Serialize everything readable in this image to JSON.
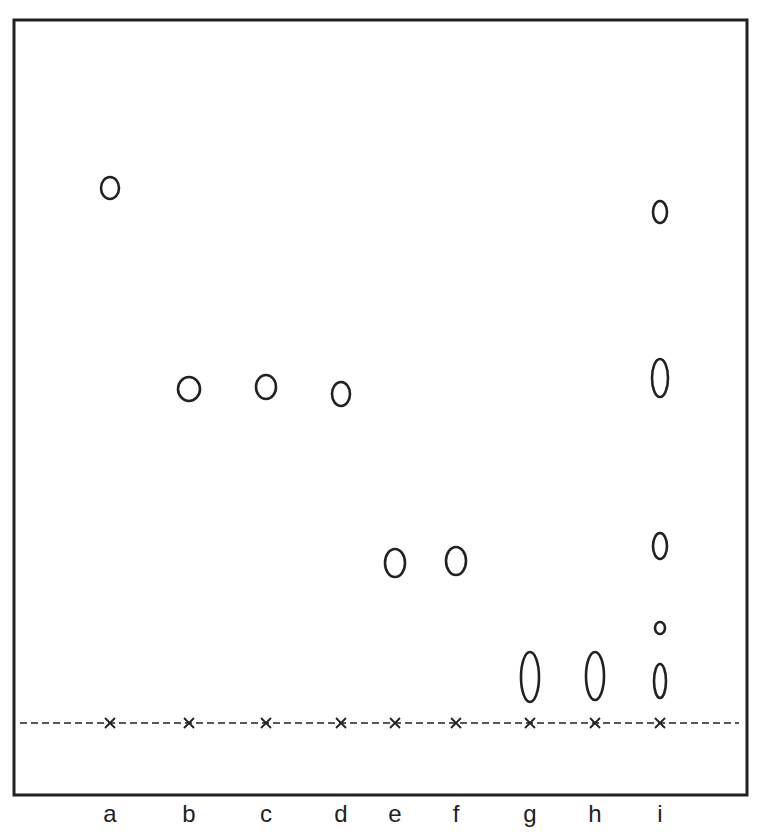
{
  "figure": {
    "type": "thin-layer chromatogram",
    "frame": {
      "x": 14,
      "y": 20,
      "width": 733,
      "height": 775
    },
    "origin_line_y": 723,
    "solvent_front_y": 20
  },
  "lanes": [
    {
      "label": "a",
      "x": 110,
      "spots": [
        {
          "cy": 188,
          "rx": 9,
          "ry": 11
        }
      ]
    },
    {
      "label": "b",
      "x": 189,
      "spots": [
        {
          "cy": 389,
          "rx": 11,
          "ry": 12
        }
      ]
    },
    {
      "label": "c",
      "x": 266,
      "spots": [
        {
          "cy": 387,
          "rx": 10,
          "ry": 12
        }
      ]
    },
    {
      "label": "d",
      "x": 341,
      "spots": [
        {
          "cy": 394,
          "rx": 9,
          "ry": 12
        }
      ]
    },
    {
      "label": "e",
      "x": 395,
      "spots": [
        {
          "cy": 563,
          "rx": 10,
          "ry": 14
        }
      ]
    },
    {
      "label": "f",
      "x": 456,
      "spots": [
        {
          "cy": 561,
          "rx": 10,
          "ry": 14
        }
      ]
    },
    {
      "label": "g",
      "x": 530,
      "spots": [
        {
          "cy": 677,
          "rx": 9,
          "ry": 25
        }
      ]
    },
    {
      "label": "h",
      "x": 595,
      "spots": [
        {
          "cy": 676,
          "rx": 9,
          "ry": 24
        }
      ]
    },
    {
      "label": "i",
      "x": 660,
      "spots": [
        {
          "cy": 212,
          "rx": 7,
          "ry": 11
        },
        {
          "cy": 378,
          "rx": 8,
          "ry": 19
        },
        {
          "cy": 546,
          "rx": 7,
          "ry": 13
        },
        {
          "cy": 628,
          "rx": 5,
          "ry": 6
        },
        {
          "cy": 681,
          "rx": 6,
          "ry": 17
        }
      ]
    }
  ],
  "colors": {
    "ink": "#222222",
    "background": "#ffffff"
  }
}
